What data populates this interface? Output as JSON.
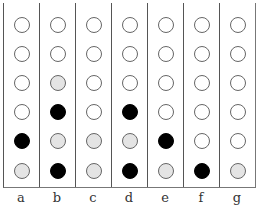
{
  "diagram": {
    "columns": [
      "a",
      "b",
      "c",
      "d",
      "e",
      "f",
      "g"
    ],
    "rows_top_to_bottom": 6,
    "legend": {
      "W": "white/empty circle",
      "G": "light gray circle",
      "B": "black filled circle"
    },
    "colors": {
      "W": "#ffffff",
      "G": "#e4e4e4",
      "B": "#000000"
    },
    "cells": {
      "a": [
        "W",
        "W",
        "W",
        "W",
        "B",
        "G"
      ],
      "b": [
        "W",
        "W",
        "G",
        "B",
        "G",
        "B"
      ],
      "c": [
        "W",
        "W",
        "W",
        "W",
        "G",
        "G"
      ],
      "d": [
        "W",
        "W",
        "W",
        "B",
        "G",
        "B"
      ],
      "e": [
        "W",
        "W",
        "W",
        "W",
        "B",
        "G"
      ],
      "f": [
        "W",
        "W",
        "W",
        "W",
        "W",
        "B"
      ],
      "g": [
        "W",
        "W",
        "W",
        "W",
        "W",
        "G"
      ]
    }
  }
}
